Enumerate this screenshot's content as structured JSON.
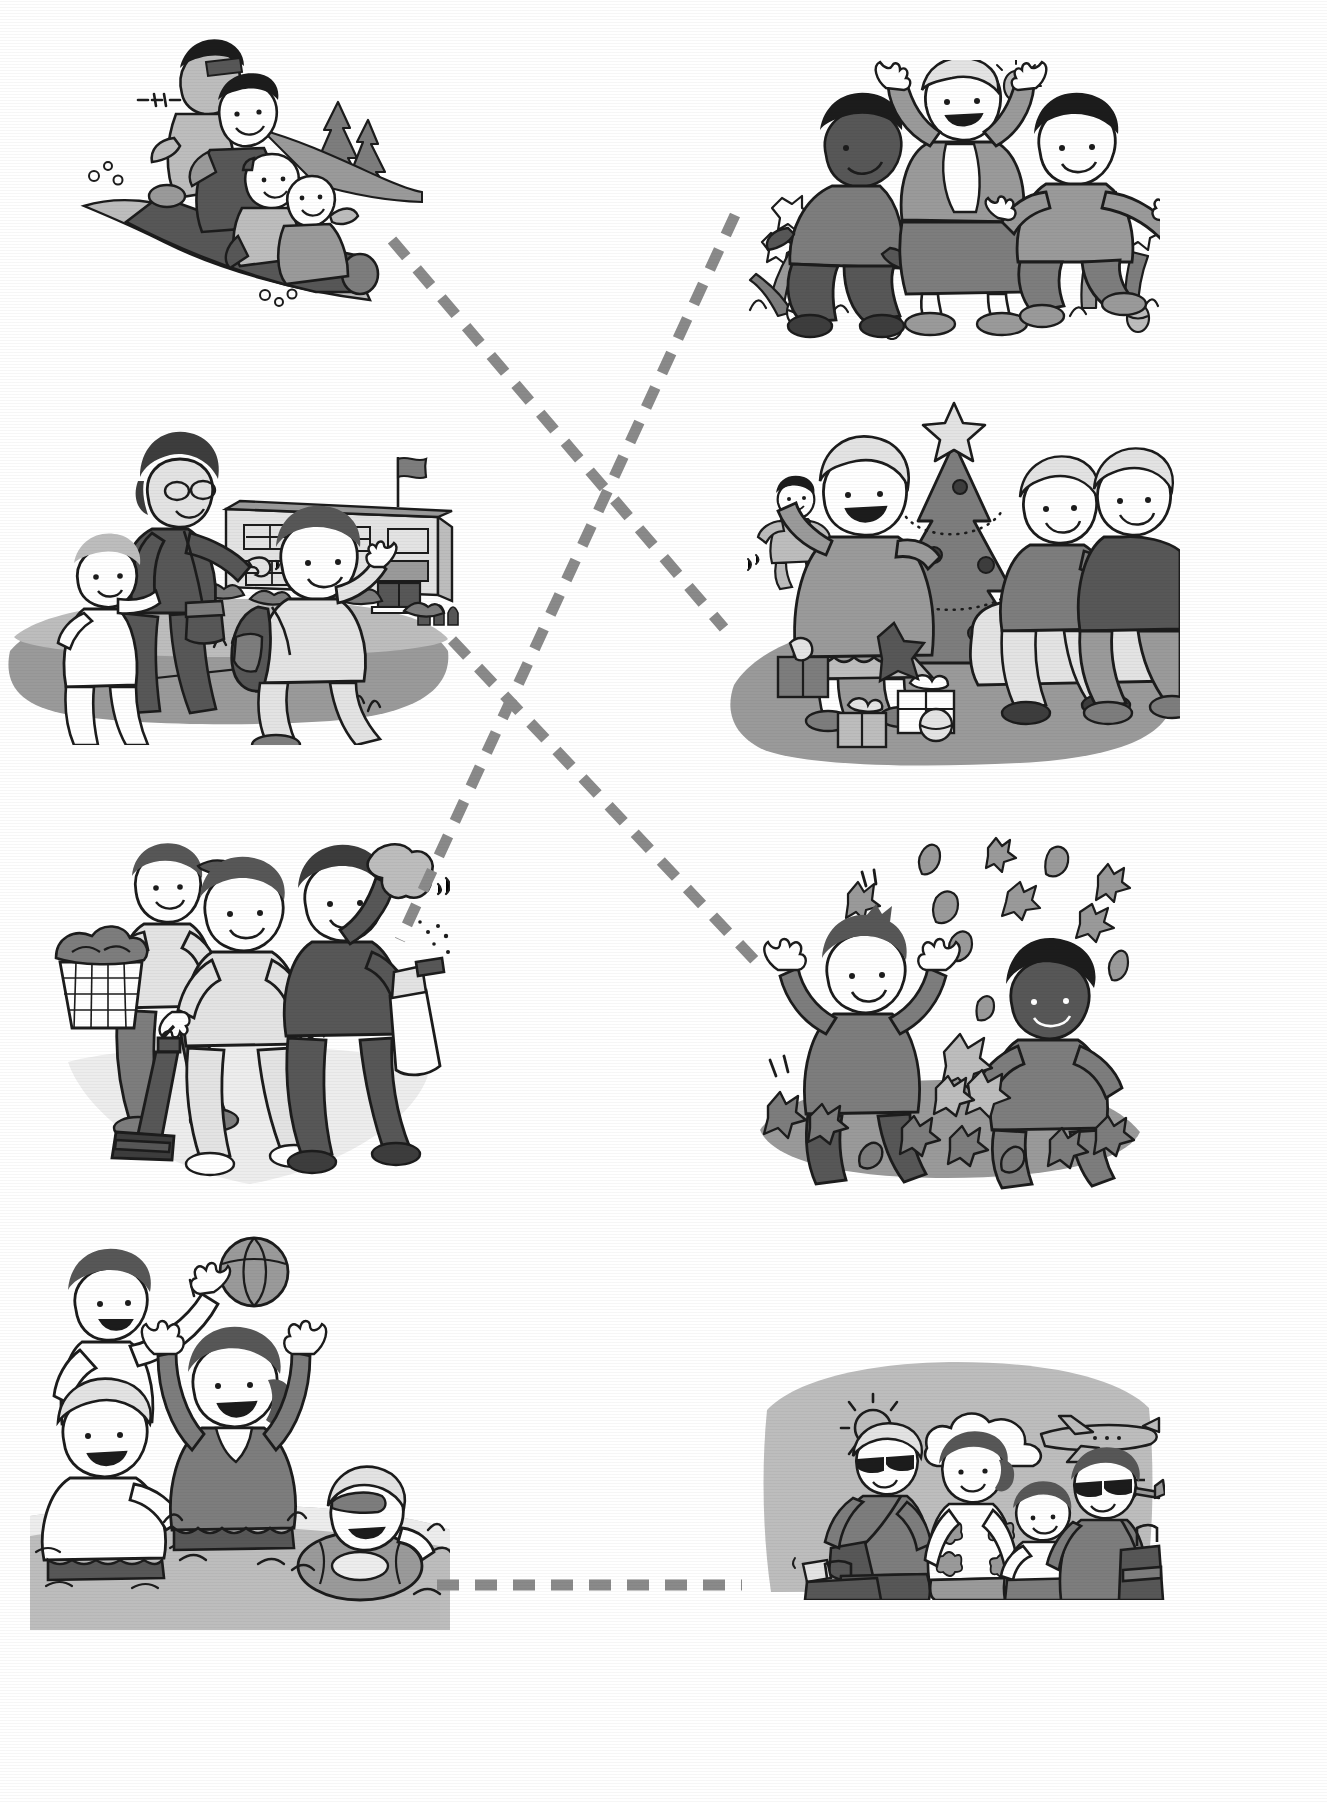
{
  "page": {
    "type": "matching-exercise",
    "background_color": "#ffffff",
    "width": 1327,
    "height": 1802
  },
  "style": {
    "connector_color": "#8a8a8a",
    "connector_dash_length": 22,
    "connector_gap_length": 16,
    "connector_width": 11,
    "ink_color": "#1c1c1c",
    "tone_light": "#e3e3e3",
    "tone_mid": "#b4b4b4",
    "tone_dark": "#7d7d7d",
    "tone_darker": "#575757",
    "ground_light": "#ededed",
    "ground_mid": "#bdbdbd",
    "ground_dark": "#9a9a9a"
  },
  "left_column": [
    {
      "id": "sledding",
      "label": "Winter sledding",
      "description": "Four people in winter coats, hats and goggles sliding down a snowy hill on a toboggan, fir trees in the background",
      "season": "winter",
      "x": 30,
      "y": 10,
      "w": 400,
      "h": 300,
      "elements": [
        "toboggan",
        "four-riders",
        "snow-spray",
        "fir-trees",
        "motion-lines"
      ]
    },
    {
      "id": "back-to-school",
      "label": "Back to school",
      "description": "A mother with glasses waving goodbye, holding a toddler's hand, while a boy with a backpack walks toward the school building with a flag on the roof",
      "season": "autumn",
      "x": 0,
      "y": 415,
      "w": 460,
      "h": 330,
      "elements": [
        "mother",
        "toddler",
        "schoolboy-with-backpack",
        "school-building",
        "flag",
        "shoulder-bag",
        "bushes",
        "grass-tufts",
        "ground-oval"
      ]
    },
    {
      "id": "spring-cleaning",
      "label": "Spring cleaning",
      "description": "Three people cleaning house: a girl with a ponytail carrying a laundry basket, a boy pushing a vacuum cleaner, and a person spraying and wiping with a cloth",
      "season": "spring",
      "x": 50,
      "y": 840,
      "w": 400,
      "h": 360,
      "elements": [
        "laundry-basket",
        "vacuum-cleaner",
        "spray-bottle",
        "cleaning-cloth",
        "ground-diamond"
      ]
    },
    {
      "id": "swimming",
      "label": "Summer swimming",
      "description": "A family playing with a beach ball in the water; a child on an adult's shoulders, a woman with arms raised, and a girl in goggles with a swim ring",
      "season": "summer",
      "x": 30,
      "y": 1230,
      "w": 420,
      "h": 400,
      "elements": [
        "beach-ball",
        "child-on-shoulders",
        "woman-arms-up",
        "girl-with-swim-ring",
        "water-surface",
        "splashes"
      ]
    }
  ],
  "right_column": [
    {
      "id": "easter-egg-hunt",
      "label": "Easter egg hunt",
      "description": "Three children hunting for Easter eggs among spring flowers; one crouching, one holding an egg up with both arms raised, one running and pointing",
      "season": "spring",
      "x": 740,
      "y": 60,
      "w": 420,
      "h": 280,
      "elements": [
        "crouching-boy",
        "girl-holding-egg",
        "running-girl",
        "daffodils",
        "easter-eggs",
        "grass"
      ]
    },
    {
      "id": "christmas",
      "label": "Christmas",
      "description": "A decorated Christmas tree with a star on top, a little girl holding a doll, wrapped presents on the floor, and grandparents sitting together",
      "season": "winter",
      "x": 720,
      "y": 395,
      "w": 460,
      "h": 390,
      "elements": [
        "christmas-tree",
        "star-topper",
        "tinsel-garland",
        "baubles",
        "girl-with-doll",
        "wrapped-presents",
        "seated-grandparents",
        "ground-oval"
      ]
    },
    {
      "id": "autumn-leaves",
      "label": "Playing in autumn leaves",
      "description": "A boy throwing fallen leaves into the air with both hands up and a girl gathering an armful of leaves, standing in a pile of leaves",
      "season": "autumn",
      "x": 750,
      "y": 830,
      "w": 400,
      "h": 360,
      "elements": [
        "falling-leaves",
        "boy-arms-up",
        "girl-with-leaves",
        "leaf-pile",
        "ground-mound"
      ]
    },
    {
      "id": "summer-holiday",
      "label": "Going on summer holiday",
      "description": "A family with suitcases and sunglasses walking under a sun and cloud, an aeroplane and a helicopter flying overhead",
      "season": "summer",
      "x": 745,
      "y": 1280,
      "w": 420,
      "h": 320,
      "elements": [
        "sun",
        "cloud",
        "aeroplane",
        "helicopter",
        "father-with-sunglasses",
        "mother",
        "small-child",
        "boy-with-sunglasses",
        "suitcases",
        "shoulder-bag",
        "camera",
        "ground-panel"
      ]
    }
  ],
  "connectors": [
    {
      "id": "sledding-to-christmas",
      "from": "sledding",
      "to": "christmas",
      "from_point": [
        392,
        240
      ],
      "to_point": [
        724,
        628
      ],
      "style": "dashed"
    },
    {
      "id": "easter-to-cleaning",
      "from": "easter-egg-hunt",
      "to": "spring-cleaning",
      "from_point": [
        735,
        215
      ],
      "to_point": [
        400,
        940
      ],
      "style": "dashed"
    },
    {
      "id": "school-to-autumn",
      "from": "back-to-school",
      "to": "autumn-leaves",
      "from_point": [
        452,
        640
      ],
      "to_point": [
        762,
        968
      ],
      "style": "dashed"
    },
    {
      "id": "swimming-to-holiday",
      "from": "swimming",
      "to": "summer-holiday",
      "from_point": [
        437,
        1585
      ],
      "to_point": [
        742,
        1585
      ],
      "style": "dashed"
    }
  ]
}
